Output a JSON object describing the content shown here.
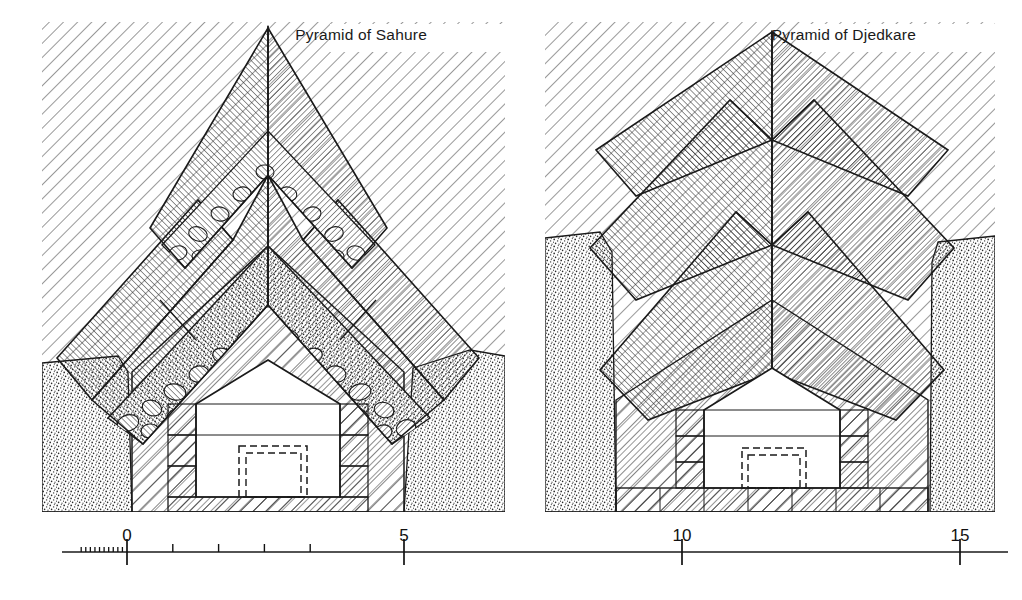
{
  "figure": {
    "kind": "architectural-section-diagram",
    "background_color": "#ffffff",
    "ink_color": "#1a1a1a",
    "width": 1022,
    "height": 600
  },
  "panels": [
    {
      "id": "sahure",
      "title": "Pyramid of Sahure",
      "title_x": 427,
      "title_y": 40,
      "frame": {
        "x": 42,
        "y": 22,
        "w": 463,
        "h": 490
      },
      "features": [
        "three nested gabled roof-beam layers",
        "rubble stone fill between gable layers",
        "limestone bedrock cut shown with stipple",
        "burial chamber with dashed sarcophagus outline",
        "diagonal hatch core masonry"
      ]
    },
    {
      "id": "djedkare",
      "title": "Pyramid of Djedkare",
      "title_x": 916,
      "title_y": 40,
      "frame": {
        "x": 545,
        "y": 22,
        "w": 450,
        "h": 490
      },
      "features": [
        "three nested gabled roof-beam layers",
        "no rubble fill between gable layers",
        "limestone bedrock cut shown with stipple",
        "burial chamber with dashed sarcophagus outline",
        "paved block floor course beneath chamber"
      ]
    }
  ],
  "scale_bar": {
    "y": 552,
    "x_start": 62,
    "x_end": 1008,
    "unit_px_per_division": 45.8,
    "zero_x": 127,
    "major_labels": [
      {
        "text": "0",
        "value": 0,
        "x": 127,
        "label_y": 541
      },
      {
        "text": "5",
        "value": 5,
        "x": 404,
        "label_y": 541
      },
      {
        "text": "10",
        "value": 10,
        "x": 682,
        "label_y": 541
      },
      {
        "text": "15",
        "value": 15,
        "x": 960,
        "label_y": 541
      }
    ],
    "intermediate_tick_values": [
      1,
      2,
      3,
      4
    ],
    "subdivision_count_left_of_zero": 10,
    "subdivision_span_values": [
      -1,
      0
    ],
    "tick_height_major": 13,
    "tick_height_minor": 8,
    "tick_height_sub": 5
  },
  "legend_textures": {
    "core_masonry": "diagonal-hatch",
    "roof_beams": "fine-parallel-hatch",
    "bedrock": "stipple",
    "rubble_fill": "irregular-stones",
    "chamber_void": "white",
    "sarcophagus": "dashed-outline"
  }
}
